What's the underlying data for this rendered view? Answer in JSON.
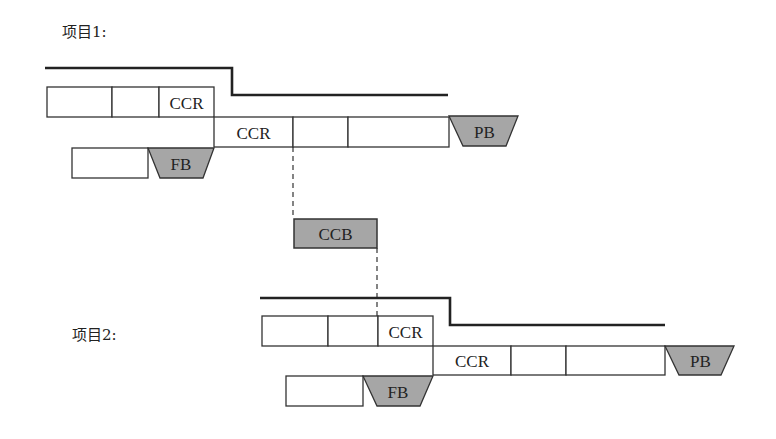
{
  "diagram": {
    "type": "critical-chain-multi-project",
    "projects": [
      {
        "label": "项目1:",
        "resource_line": {
          "high_y": 68,
          "low_y": 95,
          "start_x": 45,
          "step_x": 232,
          "end_x": 448
        },
        "row1": {
          "y": 87,
          "h": 30,
          "cells": [
            {
              "x": 47,
              "w": 65,
              "text": ""
            },
            {
              "x": 112,
              "w": 47,
              "text": ""
            },
            {
              "x": 159,
              "w": 55,
              "text": "CCR"
            }
          ]
        },
        "row2": {
          "y": 117,
          "h": 30,
          "cells": [
            {
              "x": 214,
              "w": 79,
              "text": "CCR"
            },
            {
              "x": 293,
              "w": 55,
              "text": ""
            },
            {
              "x": 348,
              "w": 101,
              "text": ""
            }
          ]
        },
        "feeding": {
          "y": 148,
          "h": 30,
          "box": {
            "x": 72,
            "w": 76
          },
          "buffer": {
            "label": "FB",
            "top_x1": 148,
            "top_x2": 214,
            "bot_x1": 160,
            "bot_x2": 203
          }
        },
        "project_buffer": {
          "label": "PB",
          "y": 116,
          "h": 30,
          "top_x1": 449,
          "top_x2": 518,
          "bot_x1": 463,
          "bot_x2": 506
        }
      },
      {
        "label": "项目2:",
        "resource_line": {
          "high_y": 298,
          "low_y": 325,
          "start_x": 260,
          "step_x": 450,
          "end_x": 665
        },
        "row1": {
          "y": 316,
          "h": 30,
          "cells": [
            {
              "x": 262,
              "w": 66,
              "text": ""
            },
            {
              "x": 328,
              "w": 50,
              "text": ""
            },
            {
              "x": 378,
              "w": 55,
              "text": "CCR"
            }
          ]
        },
        "row2": {
          "y": 346,
          "h": 29,
          "cells": [
            {
              "x": 433,
              "w": 78,
              "text": "CCR"
            },
            {
              "x": 511,
              "w": 55,
              "text": ""
            },
            {
              "x": 566,
              "w": 99,
              "text": ""
            }
          ]
        },
        "feeding": {
          "y": 376,
          "h": 30,
          "box": {
            "x": 286,
            "w": 77
          },
          "buffer": {
            "label": "FB",
            "top_x1": 363,
            "top_x2": 433,
            "bot_x1": 377,
            "bot_x2": 420
          }
        },
        "project_buffer": {
          "label": "PB",
          "y": 346,
          "h": 29,
          "top_x1": 665,
          "top_x2": 734,
          "bot_x1": 679,
          "bot_x2": 721
        }
      }
    ],
    "capacity_buffer": {
      "label": "CCB",
      "x": 294,
      "y": 219,
      "w": 83,
      "h": 29
    },
    "dashed_links": [
      {
        "x": 293,
        "y1": 147,
        "y2": 219
      },
      {
        "x": 377,
        "y1": 248,
        "y2": 316
      }
    ],
    "colors": {
      "buffer_fill": "#a6a6a6",
      "stroke": "#333333",
      "text": "#222222",
      "background": "#ffffff"
    }
  }
}
